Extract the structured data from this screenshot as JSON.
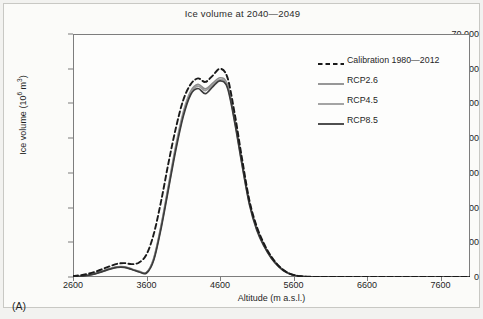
{
  "panel": {
    "label": "(A)"
  },
  "chart_data": {
    "type": "line",
    "title": "Ice volume at 2040—2049",
    "xlabel": "Altitude (m a.s.l.)",
    "ylabel": "Ice volume (10⁶ m³)",
    "ylabel_main": "Ice volume (10",
    "ylabel_sup": "6",
    "ylabel_tail": " m",
    "ylabel_sup2": "3",
    "ylabel_close": ")",
    "xlim": [
      2600,
      8000
    ],
    "ylim": [
      0,
      70000
    ],
    "grid": false,
    "legend_position": "top-right",
    "xticks": [
      2600,
      3600,
      4600,
      5600,
      6600,
      7600
    ],
    "xtick_labels": [
      "2600",
      "3600",
      "4600",
      "5600",
      "6600",
      "7600"
    ],
    "yticks": [
      0,
      10000,
      20000,
      30000,
      40000,
      50000,
      60000,
      70000
    ],
    "ytick_labels": [
      "0",
      "10,000",
      "20,000",
      "30,000",
      "40,000",
      "50,000",
      "60,000",
      "70,000"
    ],
    "colors": {
      "calibration": "#1a1a1a",
      "rcp26": "#8c8c8c",
      "rcp45": "#9a9a9a",
      "rcp85": "#3c3c3c"
    },
    "series": [
      {
        "name": "Calibration 1980—2012",
        "style": "dashed",
        "color": "#1a1a1a",
        "x": [
          2600,
          2700,
          2800,
          2900,
          3000,
          3100,
          3200,
          3300,
          3400,
          3500,
          3600,
          3700,
          3800,
          3900,
          4000,
          4100,
          4200,
          4300,
          4400,
          4500,
          4600,
          4700,
          4800,
          4900,
          5000,
          5100,
          5200,
          5300,
          5400,
          5500,
          5600,
          5700,
          5800,
          6000,
          6400,
          7000,
          7600,
          8000
        ],
        "values": [
          300,
          500,
          900,
          1500,
          2300,
          3100,
          3800,
          4000,
          3700,
          4200,
          6500,
          12500,
          22000,
          33000,
          43000,
          51000,
          55500,
          57200,
          56200,
          58000,
          60000,
          57500,
          47000,
          34000,
          22000,
          14500,
          9500,
          5800,
          3200,
          1500,
          600,
          200,
          80,
          30,
          10,
          0,
          0,
          0
        ]
      },
      {
        "name": "RCP2.6",
        "style": "solid",
        "color": "#8c8c8c",
        "x": [
          2600,
          2700,
          2800,
          2900,
          3000,
          3100,
          3200,
          3300,
          3400,
          3500,
          3600,
          3700,
          3800,
          3900,
          4000,
          4100,
          4200,
          4300,
          4400,
          4500,
          4600,
          4700,
          4800,
          4900,
          5000,
          5100,
          5200,
          5300,
          5400,
          5500,
          5600,
          5700,
          5800,
          6000,
          6400,
          7000,
          7600,
          8000
        ],
        "values": [
          100,
          200,
          500,
          1000,
          1700,
          2400,
          2900,
          2900,
          2300,
          1600,
          1300,
          5500,
          15000,
          26500,
          38000,
          47500,
          53500,
          55500,
          54200,
          55800,
          57400,
          55500,
          45500,
          33000,
          21500,
          14000,
          9200,
          5600,
          3100,
          1400,
          550,
          180,
          70,
          25,
          8,
          0,
          0,
          0
        ]
      },
      {
        "name": "RCP4.5",
        "style": "solid",
        "color": "#9a9a9a",
        "x": [
          2600,
          2700,
          2800,
          2900,
          3000,
          3100,
          3200,
          3300,
          3400,
          3500,
          3600,
          3700,
          3800,
          3900,
          4000,
          4100,
          4200,
          4300,
          4400,
          4500,
          4600,
          4700,
          4800,
          4900,
          5000,
          5100,
          5200,
          5300,
          5400,
          5500,
          5600,
          5700,
          5800,
          6000,
          6400,
          7000,
          7600,
          8000
        ],
        "values": [
          100,
          200,
          480,
          960,
          1650,
          2350,
          2850,
          2850,
          2250,
          1550,
          1250,
          5300,
          14700,
          26000,
          37400,
          46900,
          53000,
          55000,
          53700,
          55300,
          56900,
          55000,
          45000,
          32600,
          21200,
          13800,
          9000,
          5500,
          3050,
          1380,
          540,
          175,
          68,
          24,
          8,
          0,
          0,
          0
        ]
      },
      {
        "name": "RCP8.5",
        "style": "solid",
        "color": "#3c3c3c",
        "x": [
          2600,
          2700,
          2800,
          2900,
          3000,
          3100,
          3200,
          3300,
          3400,
          3500,
          3600,
          3700,
          3800,
          3900,
          4000,
          4100,
          4200,
          4300,
          4400,
          4500,
          4600,
          4700,
          4800,
          4900,
          5000,
          5100,
          5200,
          5300,
          5400,
          5500,
          5600,
          5700,
          5800,
          6000,
          6400,
          7000,
          7600,
          8000
        ],
        "values": [
          100,
          180,
          450,
          900,
          1550,
          2250,
          2750,
          2750,
          2150,
          1450,
          1150,
          5000,
          14200,
          25500,
          36800,
          46300,
          52500,
          54300,
          52800,
          54800,
          56500,
          54500,
          44500,
          32200,
          20900,
          13500,
          8800,
          5350,
          2950,
          1340,
          520,
          165,
          62,
          22,
          7,
          0,
          0,
          0
        ]
      }
    ]
  },
  "legend": {
    "items": [
      {
        "label": "Calibration 1980—2012",
        "style": "dashed",
        "color": "#1a1a1a"
      },
      {
        "label": "RCP2.6",
        "style": "solid",
        "color": "#8c8c8c"
      },
      {
        "label": "RCP4.5",
        "style": "solid",
        "color": "#9a9a9a"
      },
      {
        "label": "RCP8.5",
        "style": "solid",
        "color": "#3c3c3c"
      }
    ]
  }
}
